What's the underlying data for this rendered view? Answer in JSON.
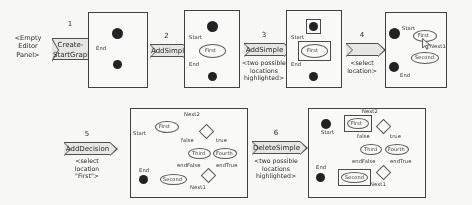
{
  "figure": {
    "empty_panel_label": "<Empty\nEditor\nPanel>"
  },
  "empty_panel": {
    "line1": "<Empty",
    "line2": "Editor",
    "line3": "Panel>"
  },
  "steps": [
    {
      "number": "1",
      "label": "Create-",
      "label2": "StartGraph",
      "note": ""
    },
    {
      "number": "2",
      "label": "AddSimple",
      "note": ""
    },
    {
      "number": "3",
      "label": "AddSimple",
      "note": "<two possible\nlocations\nhighlighted>",
      "note_line1": "<two possible",
      "note_line2": "locations",
      "note_line3": "highlighted>"
    },
    {
      "number": "4",
      "label": "",
      "note": "<select\nlocation>",
      "note_line1": "<select",
      "note_line2": "location>"
    },
    {
      "number": "5",
      "label": "AddDecision",
      "note": "<select\nlocation\n\"First\">",
      "note_line1": "<select",
      "note_line2": "location",
      "note_line3": "\"First\">"
    },
    {
      "number": "6",
      "label": "DeleteSimple",
      "note": "<two possible\nlocations\nhighlighted>",
      "note_line1": "<two possible",
      "note_line2": "locations",
      "note_line3": "highlighted>"
    }
  ],
  "panels": [
    {
      "id": "panel-1",
      "caption": "start graph",
      "labels": [
        "End"
      ]
    },
    {
      "id": "panel-2",
      "caption": "after first AddSimple",
      "labels": [
        "Start",
        "First",
        "End"
      ]
    },
    {
      "id": "panel-3",
      "caption": "two locations highlighted",
      "labels": [
        "Start",
        "First",
        "End"
      ]
    },
    {
      "id": "panel-4",
      "caption": "after second AddSimple",
      "labels": [
        "Start",
        "First",
        "Next1",
        "Second",
        "End"
      ]
    },
    {
      "id": "panel-5",
      "caption": "after AddDecision",
      "labels": [
        "Next2",
        "First",
        "Start",
        "false",
        "true",
        "Third",
        "Fourth",
        "endFalse",
        "endTrue",
        "End",
        "Second",
        "Next1"
      ]
    },
    {
      "id": "panel-6",
      "caption": "DeleteSimple candidates highlighted",
      "labels": [
        "Next2",
        "First",
        "Start",
        "false",
        "true",
        "Third",
        "Fourth",
        "endFalse",
        "endTrue",
        "End",
        "Second",
        "Next1"
      ]
    }
  ],
  "labels": {
    "start": "Start",
    "end": "End",
    "first": "First",
    "second": "Second",
    "third": "Third",
    "fourth": "Fourth",
    "next1": "Next1",
    "next2": "Next2",
    "t": "true",
    "f": "false",
    "endtrue": "endTrue",
    "endfalse": "endFalse"
  },
  "colors": {
    "node_fill": "#1a1a1a",
    "panel_border": "#3a3a3a",
    "arrow_fill": "#e9e9e7",
    "arrow_border": "#4a4a4a",
    "text": "#1d1d1d"
  }
}
